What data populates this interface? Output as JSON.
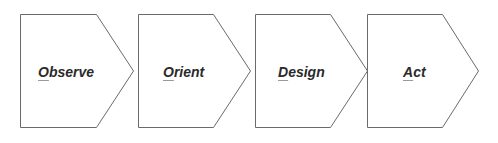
{
  "diagram": {
    "type": "process-chevron-flow",
    "stroke_color": "#6a6a6a",
    "text_color": "#2a2a2a",
    "steps": [
      {
        "label": "Observe",
        "mnemonic": "O",
        "rest": "bserve"
      },
      {
        "label": "Orient",
        "mnemonic": "O",
        "rest": "rient"
      },
      {
        "label": "Design",
        "mnemonic": "D",
        "rest": "esign"
      },
      {
        "label": "Act",
        "mnemonic": "A",
        "rest": "ct"
      }
    ]
  }
}
